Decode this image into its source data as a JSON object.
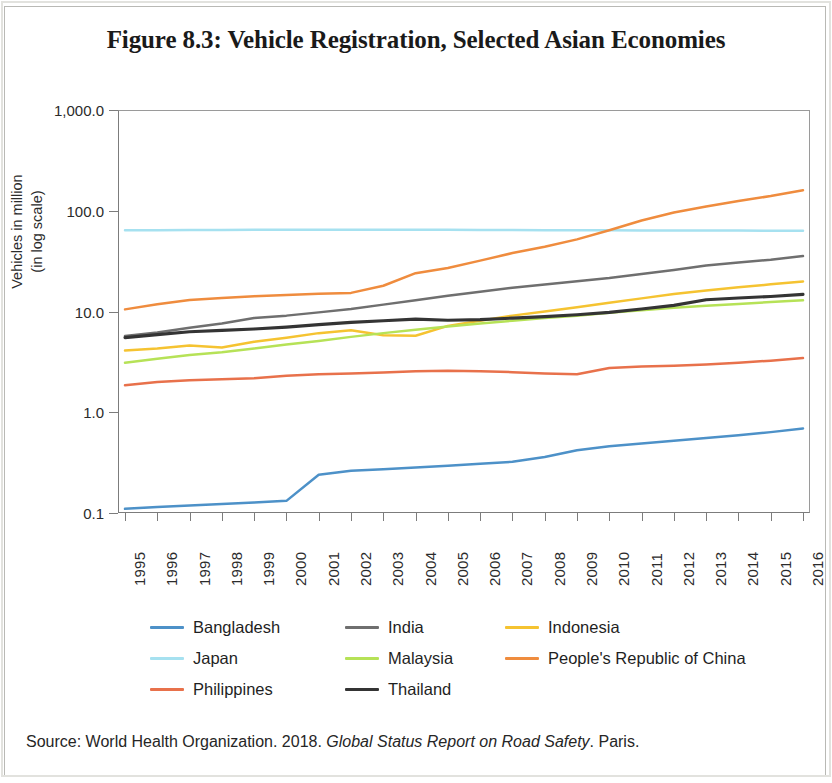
{
  "figure": {
    "title": "Figure 8.3: Vehicle Registration, Selected Asian Economies",
    "source_prefix": "Source: World Health Organization. 2018. ",
    "source_italic": "Global Status Report on Road Safety",
    "source_suffix": ". Paris."
  },
  "axis": {
    "ylabel_line1": "Vehicles in million",
    "ylabel_line2": "(in log scale)"
  },
  "legend": {
    "items": [
      {
        "label": "Bangladesh",
        "color": "#4d91c8"
      },
      {
        "label": "India",
        "color": "#6f6f6f"
      },
      {
        "label": "Indonesia",
        "color": "#f5c331"
      },
      {
        "label": "Japan",
        "color": "#a6e1f0"
      },
      {
        "label": "Malaysia",
        "color": "#b6e257"
      },
      {
        "label": "People's Republic of China",
        "color": "#ef8c3e"
      },
      {
        "label": "Philippines",
        "color": "#e8714b"
      },
      {
        "label": "Thailand",
        "color": "#343434"
      }
    ]
  },
  "chart_data": {
    "type": "line",
    "title": "Figure 8.3: Vehicle Registration, Selected Asian Economies",
    "xlabel": "",
    "ylabel": "Vehicles in million (in log scale)",
    "yscale": "log",
    "ylim": [
      0.1,
      1000.0
    ],
    "ytick_labels": [
      "1,000.0",
      "100.0",
      "10.0",
      "1.0",
      "0.1"
    ],
    "ytick_values": [
      1000.0,
      100.0,
      10.0,
      1.0,
      0.1
    ],
    "grid": false,
    "legend_position": "bottom",
    "x": [
      1995,
      1996,
      1997,
      1998,
      1999,
      2000,
      2001,
      2002,
      2003,
      2004,
      2005,
      2006,
      2007,
      2008,
      2009,
      2010,
      2011,
      2012,
      2013,
      2014,
      2015,
      2016
    ],
    "xtick_labels": [
      "1995",
      "1996",
      "1997",
      "1998",
      "1999",
      "2000",
      "2001",
      "2002",
      "2003",
      "2004",
      "2005",
      "2006",
      "2007",
      "2008",
      "2009",
      "2010",
      "2011",
      "2012",
      "2013",
      "2014",
      "2015",
      "2016"
    ],
    "series": [
      {
        "name": "Bangladesh",
        "color": "#4d91c8",
        "values": [
          0.11,
          0.115,
          0.119,
          0.123,
          0.127,
          0.132,
          0.24,
          0.262,
          0.272,
          0.283,
          0.295,
          0.308,
          0.322,
          0.36,
          0.42,
          0.46,
          0.49,
          0.52,
          0.555,
          0.59,
          0.635,
          0.69
        ]
      },
      {
        "name": "India",
        "color": "#6f6f6f",
        "values": [
          5.7,
          6.2,
          6.9,
          7.6,
          8.6,
          9.1,
          9.8,
          10.6,
          11.7,
          12.9,
          14.3,
          15.7,
          17.2,
          18.5,
          20.0,
          21.5,
          23.6,
          25.8,
          28.6,
          30.6,
          32.6,
          35.5
        ]
      },
      {
        "name": "Indonesia",
        "color": "#f5c331",
        "values": [
          4.1,
          4.3,
          4.6,
          4.4,
          5.0,
          5.5,
          6.1,
          6.5,
          5.8,
          5.75,
          7.2,
          8.1,
          9.1,
          10.0,
          11.0,
          12.2,
          13.5,
          14.9,
          16.2,
          17.4,
          18.6,
          19.9
        ]
      },
      {
        "name": "Japan",
        "color": "#a6e1f0",
        "values": [
          64.0,
          64.2,
          64.4,
          64.5,
          64.6,
          64.7,
          64.8,
          64.8,
          64.8,
          64.7,
          64.6,
          64.5,
          64.4,
          64.2,
          64.0,
          63.9,
          63.8,
          63.7,
          63.6,
          63.5,
          63.4,
          63.3
        ]
      },
      {
        "name": "Malaysia",
        "color": "#b6e257",
        "values": [
          3.1,
          3.4,
          3.7,
          3.95,
          4.3,
          4.7,
          5.1,
          5.6,
          6.1,
          6.6,
          7.1,
          7.6,
          8.1,
          8.6,
          9.1,
          9.7,
          10.3,
          10.9,
          11.4,
          11.9,
          12.4,
          12.9
        ]
      },
      {
        "name": "People's Republic of China",
        "color": "#ef8c3e",
        "values": [
          10.5,
          11.8,
          13.0,
          13.6,
          14.2,
          14.6,
          15.0,
          15.3,
          18.0,
          24.0,
          27.0,
          32.0,
          38.0,
          44.0,
          52.0,
          64.0,
          80.0,
          96.0,
          110.0,
          125.0,
          140.0,
          160.0
        ]
      },
      {
        "name": "Philippines",
        "color": "#e8714b",
        "values": [
          1.85,
          2.0,
          2.08,
          2.12,
          2.18,
          2.3,
          2.38,
          2.42,
          2.48,
          2.55,
          2.58,
          2.55,
          2.5,
          2.42,
          2.38,
          2.75,
          2.85,
          2.9,
          2.98,
          3.1,
          3.25,
          3.45
        ]
      },
      {
        "name": "Thailand",
        "color": "#343434",
        "values": [
          5.5,
          5.9,
          6.3,
          6.5,
          6.7,
          7.0,
          7.4,
          7.8,
          8.1,
          8.4,
          8.2,
          8.3,
          8.6,
          8.9,
          9.3,
          9.8,
          10.6,
          11.5,
          13.1,
          13.6,
          14.1,
          14.8
        ]
      }
    ]
  }
}
